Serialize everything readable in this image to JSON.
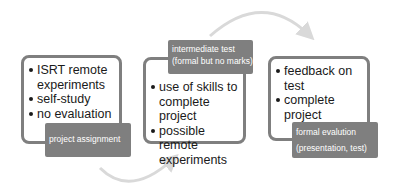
{
  "diagram": {
    "title": "",
    "colors": {
      "box_border": "#7f7f7f",
      "label_bg": "#7f7f7f",
      "label_text": "#ffffff",
      "arrow": "#d9d9d9"
    },
    "stages": [
      {
        "bullets": [
          "ISRT remote experiments",
          "self-study",
          "no evaluation"
        ],
        "label_lines": [
          "project assignment"
        ]
      },
      {
        "bullets": [
          "use of skills to complete project",
          "possible remote experiments"
        ],
        "label_lines": [
          "intermediate test",
          "(formal but no marks)"
        ]
      },
      {
        "bullets": [
          "feedback on test",
          "complete project"
        ],
        "label_lines": [
          "formal evalution",
          "(presentation, test)"
        ]
      }
    ],
    "arrows": [
      {
        "from": "stage-1",
        "to": "stage-2",
        "shape": "arc-below"
      },
      {
        "from": "stage-2",
        "to": "stage-3",
        "shape": "arc-above"
      }
    ]
  }
}
